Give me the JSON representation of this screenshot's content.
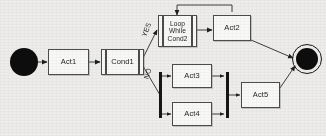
{
  "diagram": {
    "type": "activity-diagram",
    "background_color": "#f2f1ef",
    "line_color": "#3a3a3a",
    "node_fill": "#fdfdfc",
    "marker_color": "#080808",
    "nodes": {
      "start": {
        "name": "start-node",
        "label": ""
      },
      "act1": {
        "label": "Act1"
      },
      "cond1": {
        "label": "Cond1"
      },
      "loop": {
        "label_line1": "Loop",
        "label_line2": "While",
        "label_line3": "Cond2"
      },
      "act2": {
        "label": "Act2"
      },
      "act3": {
        "label": "Act3"
      },
      "act4": {
        "label": "Act4"
      },
      "act5": {
        "label": "Act5"
      },
      "fork": {
        "name": "fork-bar",
        "label": ""
      },
      "join": {
        "name": "join-bar",
        "label": ""
      },
      "end": {
        "name": "end-node",
        "label": ""
      }
    },
    "edges": {
      "yes_label": "YES",
      "no_label": "NO"
    }
  }
}
